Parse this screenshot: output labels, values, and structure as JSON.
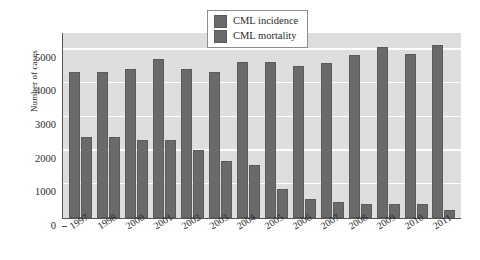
{
  "chart_data": {
    "type": "bar",
    "title": "",
    "xlabel": "",
    "ylabel": "Number of cases",
    "ylim": [
      0,
      5500
    ],
    "yticks": [
      0,
      1000,
      2000,
      3000,
      4000,
      5000
    ],
    "ytick_labels": [
      "0",
      "1000",
      "2000",
      "3000",
      "4000",
      "5000"
    ],
    "grid": true,
    "legend_position": "top-center",
    "categories": [
      "1997",
      "1998",
      "2000",
      "2001",
      "2002",
      "2003",
      "2004",
      "2005",
      "2006",
      "2007",
      "2008",
      "2009",
      "2010",
      "2011"
    ],
    "series": [
      {
        "name": "CML incidence",
        "color": "#6a6a6a",
        "values": [
          4340,
          4340,
          4430,
          4720,
          4440,
          4330,
          4650,
          4630,
          4510,
          4600,
          4860,
          5080,
          4890,
          5150
        ]
      },
      {
        "name": "CML mortality",
        "color": "#6a6a6a",
        "values": [
          2420,
          2420,
          2330,
          2330,
          2020,
          1700,
          1570,
          860,
          580,
          470,
          420,
          420,
          430,
          250
        ]
      }
    ]
  },
  "legend": {
    "items": [
      {
        "label": "CML incidence"
      },
      {
        "label": "CML mortality"
      }
    ]
  },
  "colors": {
    "bar": "#6a6a6a",
    "plot_background": "#dedede",
    "gridline": "#fdfdfd",
    "axis": "#555555",
    "text": "#2b2b2b"
  }
}
